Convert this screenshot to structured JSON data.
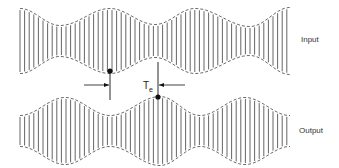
{
  "labels": {
    "input": "Input",
    "output": "Output",
    "delay_symbol": "T",
    "delay_subscript": "e"
  },
  "colors": {
    "line": "#555555",
    "envelope": "#444444",
    "marker": "#111111"
  },
  "waveforms": {
    "input": {
      "x_start": 20,
      "x_end": 290,
      "center_y": 41,
      "line_spacing": 4.6,
      "envelope_points": [
        [
          20,
          31
        ],
        [
          60,
          14
        ],
        [
          110,
          31
        ],
        [
          155,
          15
        ],
        [
          195,
          31
        ],
        [
          250,
          13
        ],
        [
          290,
          32
        ]
      ],
      "min_half": 14
    },
    "output": {
      "x_start": 20,
      "x_end": 290,
      "center_y": 131,
      "line_spacing": 4.6,
      "envelope_points": [
        [
          20,
          14
        ],
        [
          65,
          32
        ],
        [
          110,
          14
        ],
        [
          160,
          33
        ],
        [
          200,
          14
        ],
        [
          245,
          32
        ],
        [
          290,
          14
        ]
      ],
      "min_half": 14
    }
  },
  "markers": {
    "input_marker": {
      "x": 110,
      "y": 71,
      "line_top": 71,
      "line_bottom": 100
    },
    "output_marker": {
      "x": 158,
      "y": 97,
      "line_top": 62,
      "line_bottom": 97
    }
  }
}
